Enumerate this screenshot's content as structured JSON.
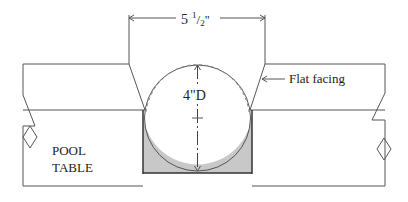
{
  "diagram": {
    "width_dimension": {
      "whole": "5",
      "frac_num": "1",
      "frac_den": "2",
      "unit": "\""
    },
    "diameter_label": "4\"D",
    "callout_label": "Flat facing",
    "table_label_line1": "POOL",
    "table_label_line2": "TABLE",
    "colors": {
      "line": "#555555",
      "pocket_fill": "#c8c8c8",
      "pocket_edge": "#333333",
      "background": "#ffffff"
    }
  }
}
